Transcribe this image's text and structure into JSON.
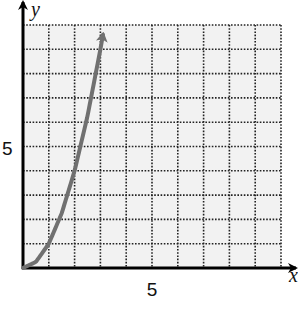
{
  "chart_data": {
    "type": "line",
    "title": "",
    "xlabel": "x",
    "ylabel": "y",
    "xlim": [
      0,
      10
    ],
    "ylim": [
      0,
      10
    ],
    "grid": true,
    "grid_style": "dotted",
    "x_ticks_labeled": [
      5
    ],
    "y_ticks_labeled": [
      5
    ],
    "series": [
      {
        "name": "curve",
        "color": "#707070",
        "x": [
          0,
          0.5,
          1,
          1.5,
          2,
          2.5,
          3,
          3.1
        ],
        "y": [
          0,
          0.25,
          1,
          2.25,
          4,
          6.25,
          9,
          9.6
        ],
        "end_arrow": true
      }
    ]
  },
  "labels": {
    "x_axis": "x",
    "y_axis": "y",
    "x_tick": "5",
    "y_tick": "5"
  },
  "colors": {
    "grid_bg": "#f2f2f2",
    "grid_line": "#222222",
    "axis": "#000000",
    "curve": "#707070"
  }
}
